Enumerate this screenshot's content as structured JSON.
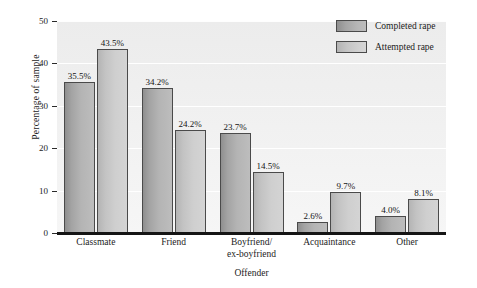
{
  "chart_data": {
    "type": "bar",
    "title": "",
    "xlabel": "Offender",
    "ylabel": "Percentage of sample",
    "categories": [
      "Classmate",
      "Friend",
      "Boyfriend/\nex-boyfriend",
      "Acquaintance",
      "Other"
    ],
    "category_lines": [
      [
        "Classmate"
      ],
      [
        "Friend"
      ],
      [
        "Boyfriend/",
        "ex-boyfriend"
      ],
      [
        "Acquaintance"
      ],
      [
        "Other"
      ]
    ],
    "series": [
      {
        "name": "Completed rape",
        "color": "#a8a8a8",
        "values": [
          35.5,
          34.2,
          23.7,
          2.6,
          4.0
        ],
        "labels": [
          "35.5%",
          "34.2%",
          "23.7%",
          "2.6%",
          "4.0%"
        ]
      },
      {
        "name": "Attempted rape",
        "color": "#cccccc",
        "values": [
          43.5,
          24.2,
          14.5,
          9.7,
          8.1
        ],
        "labels": [
          "43.5%",
          "24.2%",
          "14.5%",
          "9.7%",
          "8.1%"
        ]
      }
    ],
    "ylim": [
      0,
      50
    ],
    "yticks": [
      0,
      10,
      20,
      30,
      40,
      50
    ],
    "ytick_labels": [
      "0",
      "10",
      "20",
      "30",
      "40",
      "50"
    ],
    "grid": true,
    "grid_color": "#ffffff",
    "plot_background": "#f0f0f0",
    "legend_position": "top-right"
  },
  "legend": {
    "items": [
      {
        "label": "Completed rape"
      },
      {
        "label": "Attempted rape"
      }
    ]
  }
}
